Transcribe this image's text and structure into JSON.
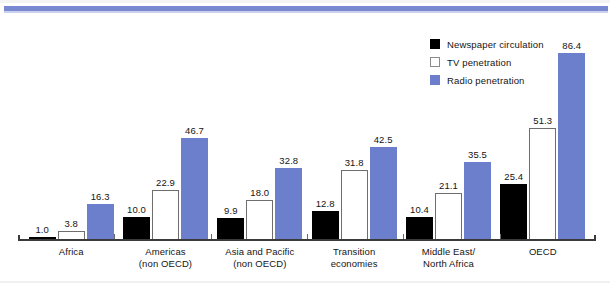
{
  "chart_data": {
    "type": "bar",
    "title": "",
    "subtitle": "",
    "xlabel": "",
    "ylabel": "",
    "ylim": [
      0,
      95
    ],
    "grid": false,
    "legend_position": "top-right",
    "categories": [
      "Africa",
      "Americas (non OECD)",
      "Asia and Pacific (non OECD)",
      "Transition economies",
      "Middle East/ North Africa",
      "OECD"
    ],
    "category_lines": [
      [
        "Africa",
        ""
      ],
      [
        "Americas",
        "(non OECD)"
      ],
      [
        "Asia and Pacific",
        "(non OECD)"
      ],
      [
        "Transition",
        "economies"
      ],
      [
        "Middle East/",
        "North Africa"
      ],
      [
        "OECD",
        ""
      ]
    ],
    "series": [
      {
        "name": "Newspaper circulation",
        "color": "#000000",
        "values": [
          1.0,
          10.0,
          9.9,
          12.8,
          10.4,
          25.4
        ],
        "labels": [
          "1.0",
          "10.0",
          "9.9",
          "12.8",
          "10.4",
          "25.4"
        ]
      },
      {
        "name": "TV penetration",
        "color": "#ffffff",
        "values": [
          3.8,
          22.9,
          18.0,
          31.8,
          21.1,
          51.3
        ],
        "labels": [
          "3.8",
          "22.9",
          "18.0",
          "31.8",
          "21.1",
          "51.3"
        ]
      },
      {
        "name": "Radio penetration",
        "color": "#6c7fcd",
        "values": [
          16.3,
          46.7,
          32.8,
          42.5,
          35.5,
          86.4
        ],
        "labels": [
          "16.3",
          "46.7",
          "32.8",
          "42.5",
          "35.5",
          "86.4"
        ]
      }
    ]
  },
  "legend": {
    "items": [
      {
        "label": "Newspaper circulation",
        "swatch": "black"
      },
      {
        "label": "TV penetration",
        "swatch": "white"
      },
      {
        "label": "Radio penetration",
        "swatch": "blue"
      }
    ]
  },
  "colors": {
    "accent_rule": "#6c7fcd",
    "radio_series": "#6c7fcd",
    "newspaper_series": "#000000",
    "tv_series": "#ffffff",
    "axis": "#3a3a3a"
  }
}
